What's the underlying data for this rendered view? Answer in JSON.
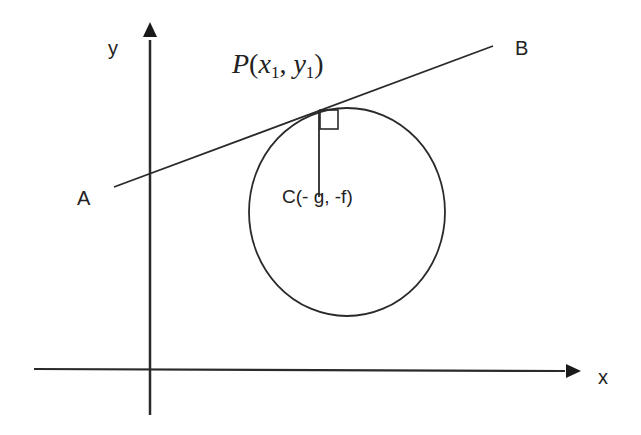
{
  "diagram": {
    "axes": {
      "x_label": "x",
      "y_label": "y"
    },
    "tangent_line": {
      "start_label": "A",
      "end_label": "B"
    },
    "point_of_contact": {
      "label_letter": "P",
      "open_paren": "(",
      "x_var": "x",
      "x_sub": "1",
      "comma": ", ",
      "y_var": "y",
      "y_sub": "1",
      "close_paren": ")"
    },
    "center": {
      "label": "C(- g, -f)"
    },
    "colors": {
      "stroke": "#2a2a2a",
      "background": "#ffffff"
    }
  }
}
